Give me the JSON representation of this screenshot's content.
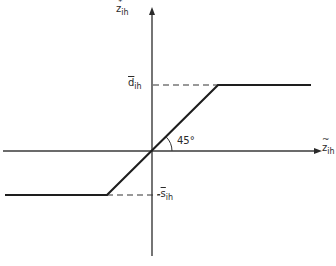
{
  "diagram": {
    "type": "piecewise-linear saturation function",
    "y_axis": {
      "label_base": "z",
      "label_mark": "*",
      "label_sub": "ih"
    },
    "x_axis": {
      "label_base": "z",
      "label_mark": "~",
      "label_sub": "ih"
    },
    "upper_level": {
      "label_base": "d",
      "label_mark": "¯",
      "label_sub": "ih"
    },
    "lower_level": {
      "label_base": "s",
      "label_mark": "¯",
      "label_sub": "ih",
      "sign": "-"
    },
    "angle_label": "45°",
    "colors": {
      "line": "#1e1e1e",
      "axis": "#3a3a3a",
      "background": "#ffffff"
    }
  }
}
